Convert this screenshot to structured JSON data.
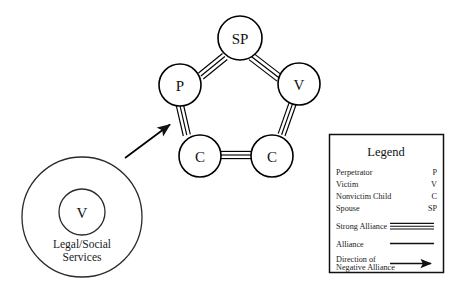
{
  "diagram": {
    "family_unit": {
      "name": "pentagon-family-structure",
      "nodes": [
        {
          "id": "sp",
          "label": "SP",
          "role": "Spouse",
          "x": 240,
          "y": 38,
          "r": 22
        },
        {
          "id": "p",
          "label": "P",
          "role": "Perpetrator",
          "x": 180,
          "y": 85,
          "r": 21
        },
        {
          "id": "v",
          "label": "V",
          "role": "Victim",
          "x": 299,
          "y": 84,
          "r": 21
        },
        {
          "id": "c_left",
          "label": "C",
          "role": "Nonvictim Child",
          "x": 200,
          "y": 156,
          "r": 21
        },
        {
          "id": "c_right",
          "label": "C",
          "role": "Nonvictim Child",
          "x": 272,
          "y": 156,
          "r": 21
        }
      ],
      "links": [
        {
          "from": "p",
          "to": "sp",
          "type": "Strong Alliance"
        },
        {
          "from": "sp",
          "to": "v",
          "type": "Strong Alliance"
        },
        {
          "from": "v",
          "to": "c_right",
          "type": "Strong Alliance"
        },
        {
          "from": "c_right",
          "to": "c_left",
          "type": "Strong Alliance"
        },
        {
          "from": "c_left",
          "to": "p",
          "type": "Strong Alliance"
        }
      ]
    },
    "external_system": {
      "name": "legal-social-services",
      "center_x": 82,
      "center_y": 217,
      "outer_r": 60,
      "inner_r": 23,
      "inner_label": "V",
      "caption_line1": "Legal/Social",
      "caption_line2": "Services"
    },
    "negative_alliance_arrow": {
      "label": "Direction of Negative Alliance",
      "from_x": 125,
      "from_y": 158,
      "to_x": 172,
      "to_y": 123
    }
  },
  "legend": {
    "title": "Legend",
    "roles": [
      {
        "term": "Perpetrator",
        "abbr": "P"
      },
      {
        "term": "Victim",
        "abbr": "V"
      },
      {
        "term": "Nonvictim Child",
        "abbr": "C"
      },
      {
        "term": "Spouse",
        "abbr": "SP"
      }
    ],
    "symbols": [
      {
        "label": "Strong Alliance",
        "style": "triple-line"
      },
      {
        "label": "Alliance",
        "style": "single-line"
      },
      {
        "label_line1": "Direction of",
        "label_line2": "Negative Alliance",
        "style": "arrow"
      }
    ]
  },
  "colors": {
    "background": "#ffffff",
    "stroke": "#111111",
    "hub_stroke": "#2a2a2a",
    "text": "#1a1a1a"
  }
}
